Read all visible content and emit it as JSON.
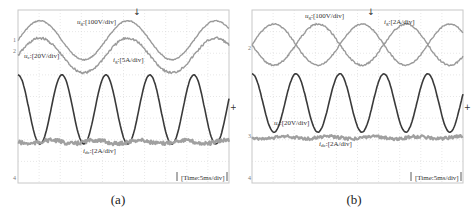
{
  "chart_data": [
    {
      "type": "line",
      "panel": "(a)",
      "title": "",
      "xlabel": "",
      "ylabel": "",
      "timebase": "Time:5ms/div",
      "grid": {
        "on": true,
        "style": "dashed",
        "x_divisions": 10,
        "y_divisions": 8
      },
      "frequency_hz": 50,
      "series": [
        {
          "name": "u_g",
          "label": "u_g:[100V/div]",
          "scale": "100V/div",
          "shape": "sine",
          "cycles": 2.4,
          "center_div": 1.4,
          "amplitude_div": 0.9,
          "phase_deg": 0,
          "color": "#9a9a9a",
          "noise": 0.05
        },
        {
          "name": "i_g",
          "label": "i_g:[5A/div]",
          "scale": "5A/div",
          "shape": "sine",
          "cycles": 2.4,
          "center_div": 2.1,
          "amplitude_div": 0.8,
          "phase_deg": 0,
          "color": "#9a9a9a",
          "noise": 0.12
        },
        {
          "name": "u_c",
          "label": "u_c:[20V/div]",
          "scale": "20V/div",
          "shape": "sine",
          "cycles": 4.8,
          "center_div": 4.6,
          "amplitude_div": 1.6,
          "phase_deg": 90,
          "color": "#3a3a3a",
          "noise": 0.02
        },
        {
          "name": "i_dc",
          "label": "i_dc:[2A/div]",
          "scale": "2A/div",
          "shape": "dc",
          "center_div": 6.1,
          "amplitude_div": 0.08,
          "color": "#a0a0a0",
          "noise": 0.18
        }
      ],
      "channel_markers": [
        "1",
        "2",
        "3",
        "4"
      ]
    },
    {
      "type": "line",
      "panel": "(b)",
      "title": "",
      "xlabel": "",
      "ylabel": "",
      "timebase": "Time:5ms/div",
      "grid": {
        "on": true,
        "style": "dashed",
        "x_divisions": 10,
        "y_divisions": 8
      },
      "frequency_hz": 50,
      "series": [
        {
          "name": "u_g",
          "label": "u_g:[100V/div]",
          "scale": "100V/div",
          "shape": "sine",
          "cycles": 2.4,
          "center_div": 1.6,
          "amplitude_div": 0.95,
          "phase_deg": 0,
          "color": "#9a9a9a",
          "noise": 0.06
        },
        {
          "name": "i_g",
          "label": "i_g:[2A/div]",
          "scale": "2A/div",
          "shape": "sine",
          "cycles": 2.4,
          "center_div": 1.6,
          "amplitude_div": 0.95,
          "phase_deg": 180,
          "color": "#9a9a9a",
          "noise": 0.08
        },
        {
          "name": "u_c",
          "label": "u_c:[20V/div]",
          "scale": "20V/div",
          "shape": "sine",
          "cycles": 4.8,
          "center_div": 4.3,
          "amplitude_div": 1.35,
          "phase_deg": 90,
          "color": "#3a3a3a",
          "noise": 0.02
        },
        {
          "name": "i_dc",
          "label": "i_dc:[2A/div]",
          "scale": "2A/div",
          "shape": "dc",
          "center_div": 5.9,
          "amplitude_div": 0.05,
          "color": "#a0a0a0",
          "noise": 0.14
        }
      ],
      "channel_markers": [
        "2",
        "3",
        "4"
      ]
    }
  ],
  "panels": [
    {
      "caption": "(a)",
      "time_label": "[Time:5ms/div]",
      "labels": {
        "ug": {
          "sym": "u",
          "sub": "g",
          "scale": ":[100V/div]"
        },
        "ig": {
          "sym": "i",
          "sub": "g",
          "scale": ":[5A/div]"
        },
        "uc": {
          "sym": "u",
          "sub": "c",
          "scale": ":[20V/div]"
        },
        "idc": {
          "sym": "i",
          "sub": "dc",
          "scale": ":[2A/div]"
        }
      },
      "markers": {
        "ch1": "1",
        "ch2": "2",
        "ch4": "4"
      }
    },
    {
      "caption": "(b)",
      "time_label": "[Time:5ms/div]",
      "labels": {
        "ug": {
          "sym": "u",
          "sub": "g",
          "scale": ":[100V/div]"
        },
        "ig": {
          "sym": "i",
          "sub": "g",
          "scale": ":[2A/div]"
        },
        "uc": {
          "sym": "u",
          "sub": "c",
          "scale": ":[20V/div]"
        },
        "idc": {
          "sym": "i",
          "sub": "dc",
          "scale": ":[2A/div]"
        }
      },
      "markers": {
        "ch2": "2",
        "ch3": "3",
        "ch4": "4"
      }
    }
  ]
}
